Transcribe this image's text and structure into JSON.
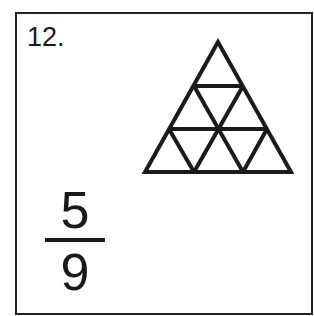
{
  "problem": {
    "number": "12.",
    "answer": {
      "numerator": "5",
      "denominator": "9"
    },
    "figure": {
      "shape": "triangle",
      "subdivisions": 9,
      "rows": 3,
      "stroke_color": "#1a1a1a"
    }
  },
  "colors": {
    "background": "#ffffff",
    "border": "#222222",
    "ink": "#1a1a1a"
  }
}
